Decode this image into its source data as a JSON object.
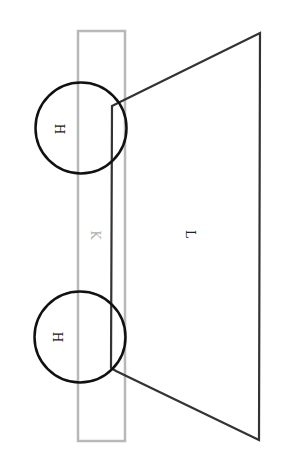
{
  "diagram": {
    "colors": {
      "background": "#ffffff",
      "rect_stroke": "#b8b8b8",
      "shape_stroke": "#333333",
      "circle_stroke": "#111111",
      "label_dark": "#222222",
      "label_light": "#b0b0b0"
    },
    "labels": {
      "rect": "K",
      "trapezoid": "L",
      "circle_top": "H",
      "circle_bottom": "H"
    }
  }
}
